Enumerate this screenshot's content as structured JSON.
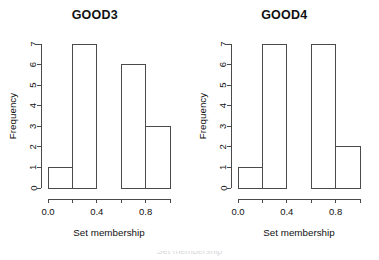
{
  "figure": {
    "background": "#ffffff",
    "stroke_color": "#4a4a4a",
    "text_color": "#111111",
    "panel_count": 2
  },
  "panels": [
    {
      "id": "good3",
      "title": "GOOD3",
      "xlabel": "Set membership",
      "ylabel": "Frequency"
    },
    {
      "id": "good4",
      "title": "GOOD4",
      "xlabel": "Set membership",
      "ylabel": "Frequency"
    }
  ],
  "axes": {
    "y_ticks": [
      "0",
      "1",
      "2",
      "3",
      "4",
      "5",
      "6",
      "7"
    ],
    "x_ticks": [
      "0.0",
      "0.2",
      "0.4",
      "0.6",
      "0.8",
      "1.0"
    ],
    "x_tick_labels_shown": [
      "0.0",
      "",
      "0.4",
      "",
      "0.8",
      ""
    ],
    "ylim": [
      0,
      7
    ],
    "xlim": [
      0,
      1
    ]
  },
  "artifact": {
    "bottom_text": "Set membership"
  },
  "chart_data": [
    {
      "type": "bar",
      "title": "GOOD3",
      "xlabel": "Set membership",
      "ylabel": "Frequency",
      "categories": [
        "0.0-0.2",
        "0.2-0.4",
        "0.4-0.6",
        "0.6-0.8",
        "0.8-1.0"
      ],
      "bin_edges": [
        0.0,
        0.2,
        0.4,
        0.6,
        0.8,
        1.0
      ],
      "values": [
        1,
        7,
        0,
        6,
        3
      ],
      "xlim": [
        0,
        1
      ],
      "ylim": [
        0,
        7
      ],
      "y_ticks": [
        0,
        1,
        2,
        3,
        4,
        5,
        6,
        7
      ],
      "x_ticks": [
        0.0,
        0.2,
        0.4,
        0.6,
        0.8,
        1.0
      ],
      "x_tick_labels": [
        "0.0",
        "",
        "0.4",
        "",
        "0.8",
        ""
      ],
      "grid": false,
      "legend": false
    },
    {
      "type": "bar",
      "title": "GOOD4",
      "xlabel": "Set membership",
      "ylabel": "Frequency",
      "categories": [
        "0.0-0.2",
        "0.2-0.4",
        "0.4-0.6",
        "0.6-0.8",
        "0.8-1.0"
      ],
      "bin_edges": [
        0.0,
        0.2,
        0.4,
        0.6,
        0.8,
        1.0
      ],
      "values": [
        1,
        7,
        0,
        7,
        2
      ],
      "xlim": [
        0,
        1
      ],
      "ylim": [
        0,
        7
      ],
      "y_ticks": [
        0,
        1,
        2,
        3,
        4,
        5,
        6,
        7
      ],
      "x_ticks": [
        0.0,
        0.2,
        0.4,
        0.6,
        0.8,
        1.0
      ],
      "x_tick_labels": [
        "0.0",
        "",
        "0.4",
        "",
        "0.8",
        ""
      ],
      "grid": false,
      "legend": false
    }
  ]
}
